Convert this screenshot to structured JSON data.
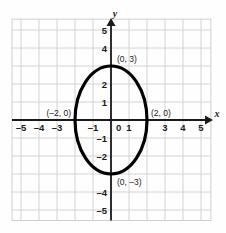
{
  "figure": {
    "title": "",
    "axis_labels": {
      "x": "x",
      "y": "y"
    }
  },
  "chart_data": {
    "type": "line",
    "title": "",
    "subtitle": "",
    "xlabel": "x",
    "ylabel": "y",
    "xlim": [
      -5.5,
      5.5
    ],
    "ylim": [
      -5.5,
      5.5
    ],
    "grid": true,
    "grid_step": 1,
    "legend": null,
    "curve": {
      "name": "ellipse",
      "equation": "x^2/4 + y^2/9 = 1",
      "center": [
        0,
        0
      ],
      "semi_axis_x": 2,
      "semi_axis_y": 3,
      "stroke": "#000000",
      "stroke_width": 3.2
    },
    "x_ticks": [
      {
        "value": -5,
        "label": "–5"
      },
      {
        "value": -4,
        "label": "–4"
      },
      {
        "value": -3,
        "label": "–3"
      },
      {
        "value": -2,
        "label": ""
      },
      {
        "value": -1,
        "label": "–1"
      },
      {
        "value": 0,
        "label": "0"
      },
      {
        "value": 1,
        "label": "1"
      },
      {
        "value": 2,
        "label": ""
      },
      {
        "value": 3,
        "label": "3"
      },
      {
        "value": 4,
        "label": "4"
      },
      {
        "value": 5,
        "label": "5"
      }
    ],
    "y_ticks": [
      {
        "value": 5,
        "label": "5"
      },
      {
        "value": 4,
        "label": "4"
      },
      {
        "value": 3,
        "label": ""
      },
      {
        "value": 2,
        "label": "2"
      },
      {
        "value": 1,
        "label": "1"
      },
      {
        "value": -1,
        "label": "–1"
      },
      {
        "value": -2,
        "label": "–2"
      },
      {
        "value": -3,
        "label": ""
      },
      {
        "value": -4,
        "label": "–4"
      },
      {
        "value": -5,
        "label": "–5"
      }
    ],
    "annotations": [
      {
        "name": "vertex-top",
        "text": "(0, 3)",
        "point": [
          0,
          3
        ],
        "anchor": "start",
        "dx": 6,
        "dy": -4
      },
      {
        "name": "vertex-bottom",
        "text": "(0, –3)",
        "point": [
          0,
          -3
        ],
        "anchor": "start",
        "dx": 6,
        "dy": 11
      },
      {
        "name": "vertex-right",
        "text": "(2, 0)",
        "point": [
          2,
          0
        ],
        "anchor": "start",
        "dx": 4,
        "dy": -4
      },
      {
        "name": "vertex-left",
        "text": "(–2, 0)",
        "point": [
          -2,
          0
        ],
        "anchor": "end",
        "dx": -4,
        "dy": -4
      }
    ],
    "colors": {
      "grid": "#cfcfcf",
      "axis": "#1a1a1a",
      "curve": "#000000",
      "background": "#fefefe",
      "text": "#1a1a1a"
    }
  }
}
